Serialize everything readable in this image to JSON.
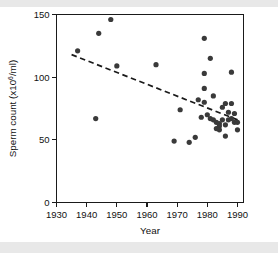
{
  "figure": {
    "background_color": "#ffffff",
    "scan_band_color": "#e8e8e8",
    "point_color": "#3a3a3a",
    "axis_color": "#1a1a1a"
  },
  "chart_data": {
    "type": "scatter",
    "title": "",
    "xlabel": "Year",
    "ylabel_prefix": "Sperm count (x10",
    "ylabel_exponent": "6",
    "ylabel_suffix": "/ml)",
    "ylabel_full": "Sperm count (x10^6/ml)",
    "xlim": [
      1930,
      1992
    ],
    "ylim": [
      0,
      150
    ],
    "xticks": [
      1930,
      1940,
      1950,
      1960,
      1970,
      1980,
      1990
    ],
    "xtick_labels": [
      "1930",
      "1940",
      "1950",
      "1960",
      "1970",
      "1980",
      "1990"
    ],
    "yticks": [
      0,
      50,
      100,
      150
    ],
    "ytick_labels": [
      "0",
      "50",
      "100",
      "150"
    ],
    "grid": false,
    "legend": null,
    "marker": "filled-circle",
    "marker_radius_px": 2.6,
    "points": [
      {
        "x": 1937,
        "y": 121
      },
      {
        "x": 1943,
        "y": 67
      },
      {
        "x": 1944,
        "y": 135
      },
      {
        "x": 1948,
        "y": 146
      },
      {
        "x": 1950,
        "y": 109
      },
      {
        "x": 1963,
        "y": 110
      },
      {
        "x": 1969,
        "y": 49
      },
      {
        "x": 1971,
        "y": 74
      },
      {
        "x": 1974,
        "y": 48
      },
      {
        "x": 1976,
        "y": 52
      },
      {
        "x": 1977,
        "y": 82
      },
      {
        "x": 1978,
        "y": 68
      },
      {
        "x": 1979,
        "y": 131
      },
      {
        "x": 1979,
        "y": 103
      },
      {
        "x": 1979,
        "y": 91
      },
      {
        "x": 1979,
        "y": 80
      },
      {
        "x": 1980,
        "y": 70
      },
      {
        "x": 1981,
        "y": 115
      },
      {
        "x": 1982,
        "y": 85
      },
      {
        "x": 1982,
        "y": 66
      },
      {
        "x": 1983,
        "y": 64
      },
      {
        "x": 1983,
        "y": 59
      },
      {
        "x": 1984,
        "y": 63
      },
      {
        "x": 1984,
        "y": 61
      },
      {
        "x": 1984,
        "y": 58
      },
      {
        "x": 1985,
        "y": 76
      },
      {
        "x": 1985,
        "y": 66
      },
      {
        "x": 1986,
        "y": 53
      },
      {
        "x": 1986,
        "y": 79
      },
      {
        "x": 1987,
        "y": 72
      },
      {
        "x": 1987,
        "y": 66
      },
      {
        "x": 1988,
        "y": 104
      },
      {
        "x": 1988,
        "y": 79
      },
      {
        "x": 1988,
        "y": 67
      },
      {
        "x": 1989,
        "y": 64
      },
      {
        "x": 1989,
        "y": 71
      },
      {
        "x": 1990,
        "y": 64
      },
      {
        "x": 1990,
        "y": 58
      },
      {
        "x": 1986,
        "y": 62
      },
      {
        "x": 1981,
        "y": 67
      }
    ],
    "trend_line": {
      "style": "dashed",
      "x_start": 1935,
      "y_start": 118,
      "x_end": 1991,
      "y_end": 65
    }
  }
}
